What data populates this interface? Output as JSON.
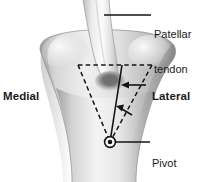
{
  "figure": {
    "type": "anatomical-diagram",
    "background_color": "#ffffff",
    "ink_color": "#1a1a1a",
    "bone_fill_light": "#f2f2f2",
    "bone_fill_mid": "#c9c9c9",
    "bone_fill_dark": "#8f8f8f",
    "tendon_fill": "#e8e8e8",
    "insertion_shadow": "#6e6e6e"
  },
  "labels": {
    "patellar_tendon": {
      "line1": "Patellar",
      "line2": "tendon"
    },
    "medial": "Medial",
    "lateral": "Lateral",
    "pivot_point": {
      "line1": "Pivot",
      "line2": "point"
    }
  },
  "annotations": {
    "dashed_triangle": {
      "description": "dashed inverted triangle over tibial tuberosity",
      "apex": [
        110,
        142
      ],
      "top_left": [
        78,
        65
      ],
      "top_right": [
        152,
        65
      ]
    },
    "solid_rotation_line": {
      "from": [
        110,
        142
      ],
      "to": [
        122,
        65
      ]
    },
    "arrows": [
      {
        "name": "upper-arrow",
        "from": [
          146,
          85
        ],
        "to": [
          123,
          85
        ],
        "direction": "left"
      },
      {
        "name": "lower-arrow",
        "from": [
          131,
          113
        ],
        "to": [
          117,
          106
        ],
        "direction": "up-left"
      }
    ],
    "pivot_marker": {
      "center": [
        110,
        142
      ],
      "radius": 5
    },
    "leader_lines": [
      {
        "name": "patellar-tendon-leader",
        "from": [
          151,
          15
        ],
        "to": [
          106,
          15
        ]
      },
      {
        "name": "pivot-point-leader",
        "from": [
          150,
          142
        ],
        "to": [
          116,
          142
        ]
      }
    ]
  }
}
